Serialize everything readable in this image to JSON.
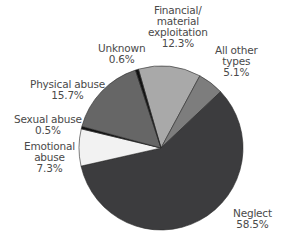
{
  "chart_data": {
    "type": "pie",
    "title": "",
    "start_angle_deg": -16,
    "direction": "clockwise",
    "slices": [
      {
        "label": "Financial/ material exploitation",
        "value": 12.3,
        "display": "12.3%",
        "color": "#a9a9a9"
      },
      {
        "label": "All other types",
        "value": 5.1,
        "display": "5.1%",
        "color": "#7d7d7d"
      },
      {
        "label": "Neglect",
        "value": 58.5,
        "display": "58.5%",
        "color": "#3c3c3e"
      },
      {
        "label": "Emotional abuse",
        "value": 7.3,
        "display": "7.3%",
        "color": "#f2f2f2"
      },
      {
        "label": "Sexual abuse",
        "value": 0.5,
        "display": "0.5%",
        "color": "#111111"
      },
      {
        "label": "Physical abuse",
        "value": 15.7,
        "display": "15.7%",
        "color": "#666666"
      },
      {
        "label": "Unknown",
        "value": 0.6,
        "display": "0.6%",
        "color": "#111111"
      }
    ]
  },
  "labels": {
    "financial": {
      "lines": [
        "Financial/",
        "material",
        "exploitation",
        "12.3%"
      ]
    },
    "all_other": {
      "lines": [
        "All other",
        "types",
        "5.1%"
      ]
    },
    "unknown": {
      "lines": [
        "Unknown",
        "0.6%"
      ]
    },
    "physical": {
      "lines": [
        "Physical abuse",
        "15.7%"
      ]
    },
    "sexual": {
      "lines": [
        "Sexual abuse",
        "0.5%"
      ]
    },
    "emotional": {
      "lines": [
        "Emotional",
        "abuse",
        "7.3%"
      ]
    },
    "neglect": {
      "lines": [
        "Neglect",
        "58.5%"
      ]
    }
  }
}
